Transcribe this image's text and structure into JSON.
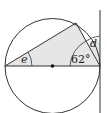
{
  "diagram": {
    "type": "circle-geometry",
    "labels": {
      "angle_e": "e",
      "angle_d": "d",
      "angle_given": "62°"
    },
    "colors": {
      "stroke": "#333333",
      "shade": "#e6e6e6",
      "center_dot": "#111111"
    },
    "elements": [
      "circle with center point",
      "horizontal diameter",
      "vertical tangent line at right end of diameter",
      "inscribed triangle on diameter (shaded)",
      "angle e at left end of diameter",
      "angle 62° at right end of diameter",
      "angle d between chord and tangent"
    ]
  }
}
